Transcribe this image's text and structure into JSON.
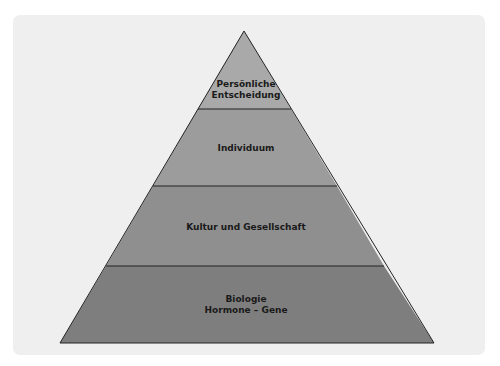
{
  "diagram": {
    "type": "pyramid",
    "levels": [
      {
        "line1": "Persönliche",
        "line2": "Entscheidung",
        "color": "#a9a9a9"
      },
      {
        "line1": "Individuum",
        "line2": "",
        "color": "#9c9c9c"
      },
      {
        "line1": "Kultur und Gesellschaft",
        "line2": "",
        "color": "#8f8f8f"
      },
      {
        "line1": "Biologie",
        "line2": "Hormone – Gene",
        "color": "#7e7e7e"
      }
    ],
    "background": "#efefef",
    "outline": "#222222"
  }
}
